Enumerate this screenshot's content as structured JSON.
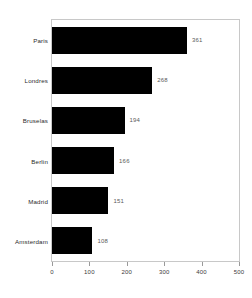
{
  "chart_data": {
    "type": "bar",
    "orientation": "horizontal",
    "title": "",
    "subtitle": "",
    "xlabel": "",
    "ylabel": "",
    "categories": [
      "Paris",
      "Londres",
      "Bruselas",
      "Berlin",
      "Madrid",
      "Amsterdam"
    ],
    "values": [
      361,
      268,
      194,
      166,
      151,
      108
    ],
    "value_labels": [
      "361",
      "268",
      "194",
      "166",
      "151",
      "108"
    ],
    "xlim": [
      0,
      500
    ],
    "xticks": [
      0,
      100,
      200,
      300,
      400,
      500
    ],
    "xtick_labels": [
      "0",
      "100",
      "200",
      "300",
      "400",
      "500"
    ],
    "grid": false,
    "legend": false,
    "bar_color": "#000000",
    "frame_color": "#c8c8c8",
    "value_label_color": "#5a5a5a",
    "category_label_color": "#2b2b2b"
  }
}
